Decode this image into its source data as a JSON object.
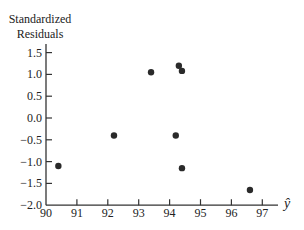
{
  "chart_data": {
    "type": "scatter",
    "title": "",
    "xlabel": "ŷ",
    "ylabel": "Standardized Residuals",
    "ylabel_lines": [
      "Standardized",
      "Residuals"
    ],
    "xlim": [
      90,
      97.5
    ],
    "ylim": [
      -2.0,
      1.65
    ],
    "xticks": [
      90,
      91,
      92,
      93,
      94,
      95,
      96,
      97
    ],
    "yticks": [
      1.5,
      1.0,
      0.5,
      0.0,
      -0.5,
      -1.0,
      -1.5,
      -2.0
    ],
    "xtick_labels": [
      "90",
      "91",
      "92",
      "93",
      "94",
      "95",
      "96",
      "97"
    ],
    "ytick_labels": [
      "1.5",
      "1.0",
      "0.5",
      "0.0",
      "−0.5",
      "−1.0",
      "−1.5",
      "−2.0"
    ],
    "grid": false,
    "legend": null,
    "points": [
      {
        "x": 90.4,
        "y": -1.1
      },
      {
        "x": 92.2,
        "y": -0.4
      },
      {
        "x": 93.4,
        "y": 1.05
      },
      {
        "x": 94.3,
        "y": 1.2
      },
      {
        "x": 94.4,
        "y": 1.08
      },
      {
        "x": 94.2,
        "y": -0.4
      },
      {
        "x": 94.4,
        "y": -1.15
      },
      {
        "x": 96.6,
        "y": -1.65
      }
    ],
    "marker_color": "#2a2a2a",
    "axis_color": "#333333"
  }
}
